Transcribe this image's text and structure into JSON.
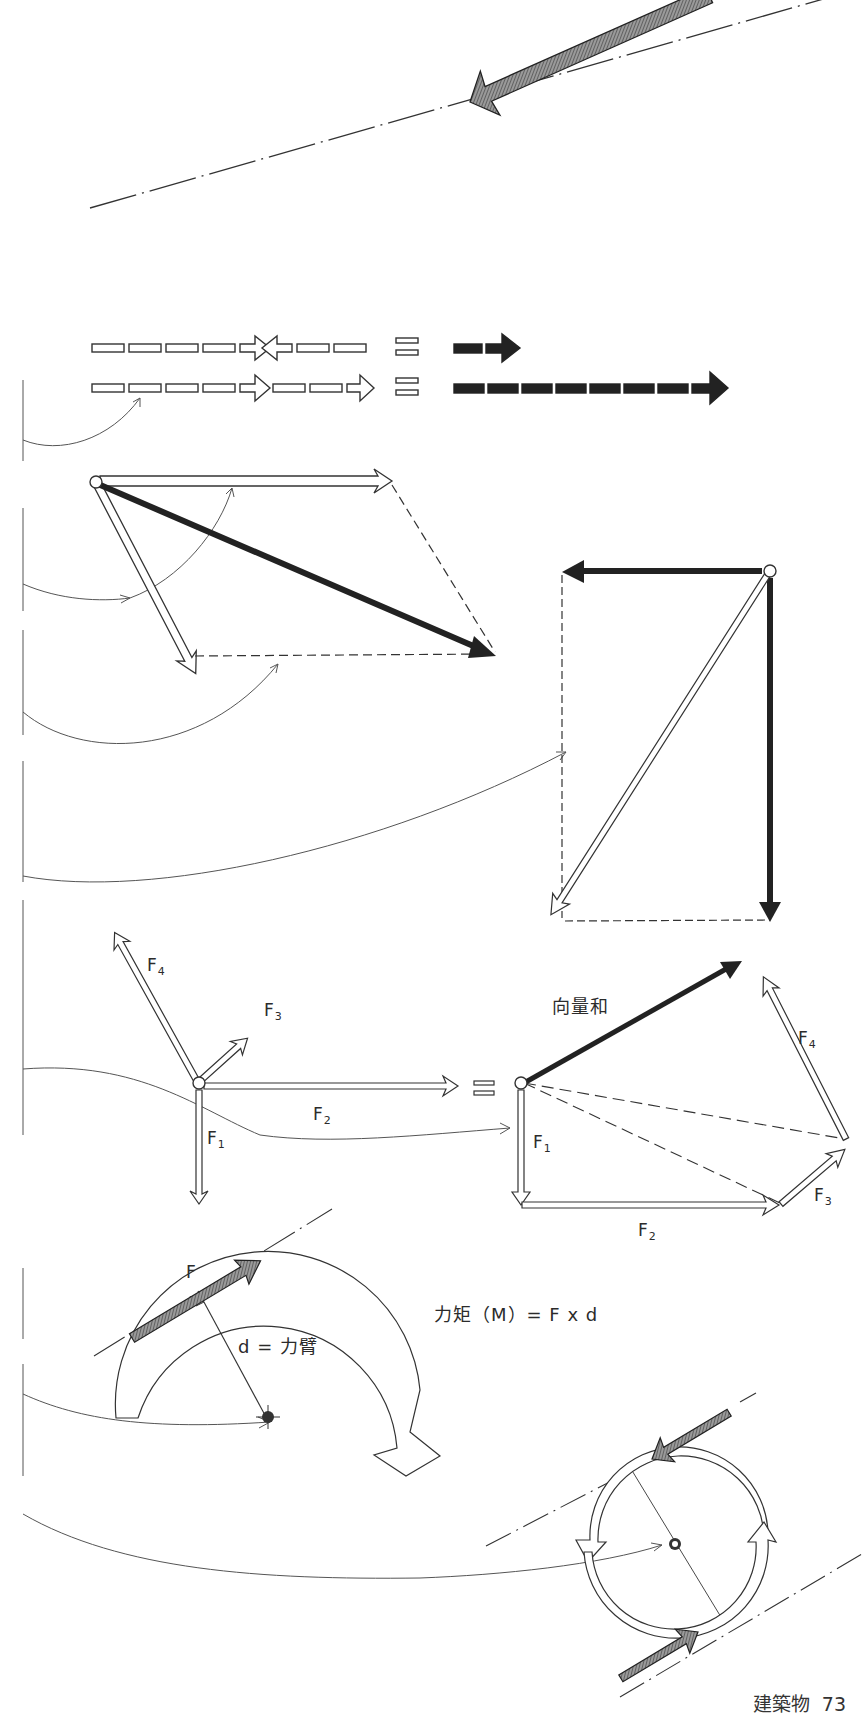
{
  "page": {
    "section": "建築物",
    "number": "73"
  },
  "diagrams": {
    "line_of_action": {
      "description": "single force arrow along a dash-dot line of action"
    },
    "collinear_addition": {
      "row1_equals": "=",
      "row2_equals": "="
    },
    "parallelogram": {
      "description": "two open arrows from a point, resultant drawn as solid diagonal"
    },
    "resolution": {
      "description": "open diagonal force resolved into two solid components"
    },
    "polygon": {
      "forces": [
        {
          "label": "F",
          "sub": "1"
        },
        {
          "label": "F",
          "sub": "2"
        },
        {
          "label": "F",
          "sub": "3"
        },
        {
          "label": "F",
          "sub": "4"
        }
      ],
      "equals": "=",
      "resultant_label": "向量和",
      "poly_labels": [
        {
          "label": "F",
          "sub": "1"
        },
        {
          "label": "F",
          "sub": "2"
        },
        {
          "label": "F",
          "sub": "3"
        },
        {
          "label": "F",
          "sub": "4"
        }
      ]
    },
    "moment": {
      "force_label": "F",
      "arm_label": "d = 力臂",
      "formula": "力矩（M）= F x d"
    },
    "couple": {
      "description": "two equal opposite parallel forces producing rotation about a center"
    }
  }
}
